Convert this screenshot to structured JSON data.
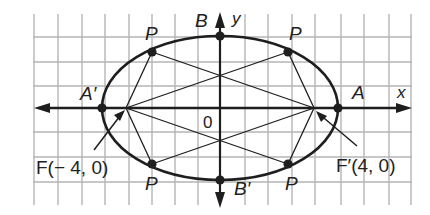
{
  "diagram": {
    "colors": {
      "grid": "#b5b5b5",
      "ink": "#1e1e1e",
      "background": "#ffffff"
    },
    "grid": {
      "x_lines": [
        34,
        58,
        82,
        105,
        129,
        152,
        175,
        198,
        245,
        268,
        292,
        315,
        341,
        364,
        389,
        411
      ],
      "y_lines": [
        37,
        62,
        86,
        132,
        157,
        182
      ],
      "x_extent": [
        33,
        412
      ],
      "y_extent": [
        14,
        205
      ]
    },
    "axes": {
      "origin": [
        220,
        108
      ],
      "x_range": [
        34,
        412
      ],
      "y_range": [
        12,
        208
      ],
      "x_label": "x",
      "y_label": "y",
      "origin_label": "0"
    },
    "ellipse": {
      "cx": 220,
      "cy": 108,
      "rx": 118,
      "ry": 72,
      "a": 5,
      "b": 3,
      "c": 4
    },
    "points": {
      "A": {
        "label": "A",
        "x": 338,
        "y": 108
      },
      "A_prime": {
        "label": "A′",
        "x": 102,
        "y": 108
      },
      "B": {
        "label": "B",
        "x": 220,
        "y": 36
      },
      "B_prime": {
        "label": "B′",
        "x": 220,
        "y": 180
      },
      "F": {
        "label": "F(−4, 0)",
        "x": 126,
        "y": 108
      },
      "F_prime": {
        "label": "F′(4, 0)",
        "x": 314,
        "y": 108
      },
      "P": [
        {
          "label": "P",
          "x": 152,
          "y": 52
        },
        {
          "label": "P",
          "x": 288,
          "y": 52
        },
        {
          "label": "P",
          "x": 152,
          "y": 164
        },
        {
          "label": "P",
          "x": 288,
          "y": 164
        }
      ]
    },
    "labels": {
      "A": "A",
      "A_prime": "A′",
      "B": "B",
      "B_prime": "B′",
      "F": "F(− 4, 0)",
      "F_prime": "F′(4, 0)",
      "P": "P",
      "x": "x",
      "y": "y",
      "origin": "0"
    }
  }
}
